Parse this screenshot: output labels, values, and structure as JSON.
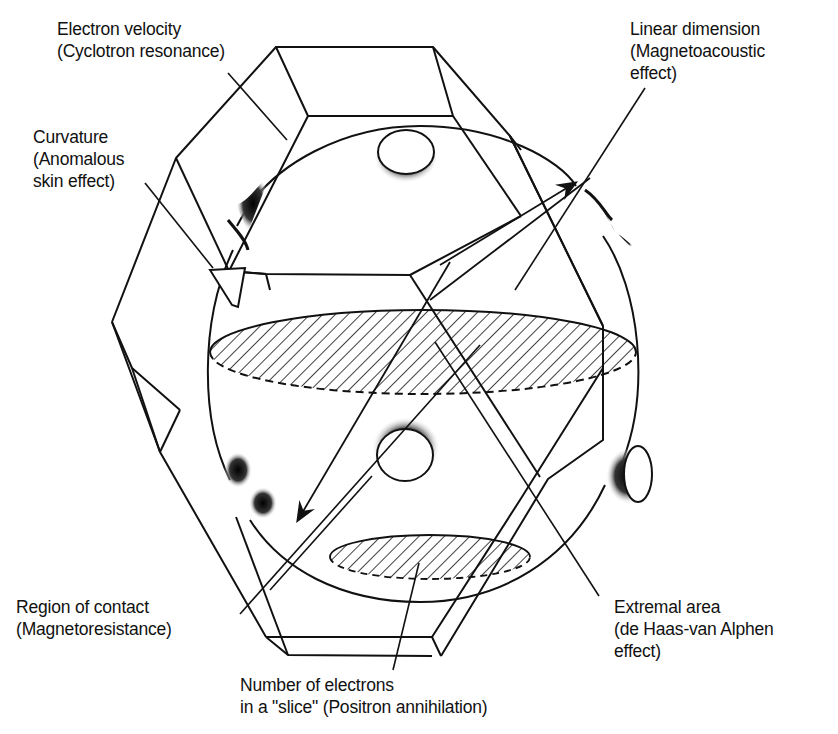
{
  "figure": {
    "colors": {
      "line": "#111111",
      "background": "#ffffff",
      "hatch": "#111111"
    }
  },
  "labels": {
    "electron_velocity": {
      "line1": "Electron velocity",
      "line2": "(Cyclotron resonance)"
    },
    "curvature": {
      "line1": "Curvature",
      "line2": "(Anomalous",
      "line3": "skin effect)"
    },
    "linear_dimension": {
      "line1": "Linear dimension",
      "line2": "(Magnetoacoustic",
      "line3": "effect)"
    },
    "region_of_contact": {
      "line1": "Region of contact",
      "line2": "(Magnetoresistance)"
    },
    "extremal_area": {
      "line1": "Extremal area",
      "line2": "(de Haas-van Alphen",
      "line3": "effect)"
    },
    "number_of_electrons": {
      "line1": "Number of electrons",
      "line2": "in a \"slice\" (Positron annihilation)"
    }
  }
}
